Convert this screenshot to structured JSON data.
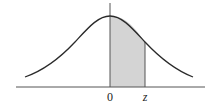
{
  "figure": {
    "labels": {
      "origin": "0",
      "z": "z"
    },
    "colors": {
      "curve": "#2a2a2a",
      "axis": "#555555",
      "shade": "#d4d4d4",
      "background": "#ffffff"
    },
    "shaded_region": {
      "from": "0",
      "to": "z"
    }
  }
}
